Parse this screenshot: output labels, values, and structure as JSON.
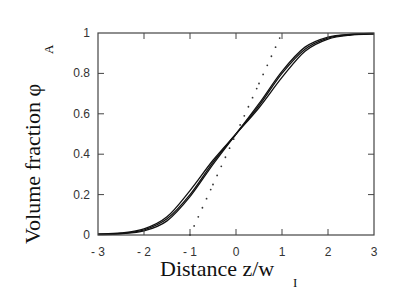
{
  "chart_data": {
    "type": "line",
    "title": "",
    "xlabel": "Distance z/w",
    "xlabel_sub": "I",
    "ylabel": "Volume fraction φ",
    "ylabel_sub": "A",
    "xlim": [
      -3,
      3
    ],
    "ylim": [
      0,
      1
    ],
    "x_ticks": [
      "- 3",
      "- 2",
      "- 1",
      "0",
      "1",
      "2",
      "3"
    ],
    "y_ticks": [
      "0",
      "0.2",
      "0.4",
      "0.6",
      "0.8",
      "1"
    ],
    "grid": false,
    "legend": null,
    "x": [
      -3,
      -2.5,
      -2,
      -1.5,
      -1,
      -0.5,
      0,
      0.5,
      1,
      1.5,
      2,
      2.5,
      3
    ],
    "series": [
      {
        "name": "profile 1 (solid)",
        "style": "solid",
        "values": [
          0.005,
          0.01,
          0.03,
          0.09,
          0.22,
          0.37,
          0.5,
          0.63,
          0.78,
          0.91,
          0.97,
          0.99,
          0.995
        ]
      },
      {
        "name": "profile 2 (solid)",
        "style": "solid",
        "values": [
          0.003,
          0.008,
          0.025,
          0.08,
          0.2,
          0.36,
          0.5,
          0.64,
          0.8,
          0.92,
          0.975,
          0.992,
          0.997
        ]
      },
      {
        "name": "profile 3 (solid)",
        "style": "solid",
        "values": [
          0.002,
          0.006,
          0.02,
          0.07,
          0.19,
          0.35,
          0.5,
          0.65,
          0.81,
          0.93,
          0.98,
          0.994,
          0.998
        ]
      },
      {
        "name": "linear approximation (dotted)",
        "style": "dotted",
        "values": [
          null,
          null,
          null,
          null,
          0.0,
          0.25,
          0.5,
          0.75,
          1.0,
          null,
          null,
          null,
          null
        ]
      }
    ]
  }
}
